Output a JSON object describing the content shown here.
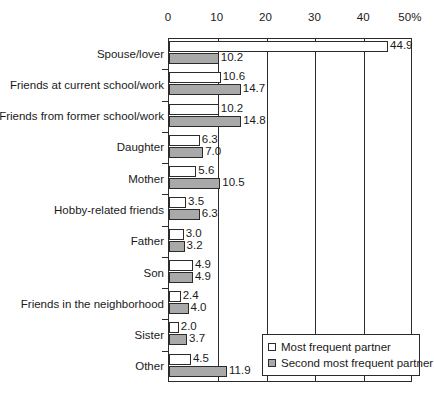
{
  "chart_data": {
    "type": "bar",
    "orientation": "horizontal",
    "title": "",
    "xlabel": "",
    "ylabel": "",
    "xlim": [
      0,
      50
    ],
    "xticks": [
      "0",
      "10",
      "20",
      "30",
      "40",
      "50%"
    ],
    "xtick_values": [
      0,
      10,
      20,
      30,
      40,
      50
    ],
    "grid": true,
    "legend_position": "bottom-right",
    "categories": [
      "Spouse/lover",
      "Friends at current school/work",
      "Friends from former school/work",
      "Daughter",
      "Mother",
      "Hobby-related friends",
      "Father",
      "Son",
      "Friends in the neighborhood",
      "Sister",
      "Other"
    ],
    "series": [
      {
        "name": "Most frequent partner",
        "color": "#ffffff",
        "values": [
          44.9,
          10.6,
          10.2,
          6.3,
          5.6,
          3.5,
          3.0,
          4.9,
          2.4,
          2.0,
          4.5
        ],
        "labels": [
          "44.9",
          "10.6",
          "10.2",
          "6.3",
          "5.6",
          "3.5",
          "3.0",
          "4.9",
          "2.4",
          "2.0",
          "4.5"
        ]
      },
      {
        "name": "Second most frequent partner",
        "color": "#a9a9a9",
        "values": [
          10.2,
          14.7,
          14.8,
          7.0,
          10.5,
          6.3,
          3.2,
          4.9,
          4.0,
          3.7,
          11.9
        ],
        "labels": [
          "10.2",
          "14.7",
          "14.8",
          "7.0",
          "10.5",
          "6.3",
          "3.2",
          "4.9",
          "4.0",
          "3.7",
          "11.9"
        ]
      }
    ]
  },
  "legend": {
    "items": [
      {
        "label": "Most frequent partner",
        "swatch": "white"
      },
      {
        "label": "Second most frequent partner",
        "swatch": "gray"
      }
    ]
  }
}
